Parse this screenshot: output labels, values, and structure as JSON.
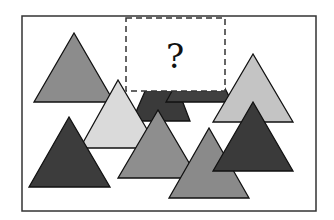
{
  "puzzle": {
    "question_mark": "?",
    "frame": {
      "x": 22,
      "y": 16,
      "width": 294,
      "height": 195,
      "stroke": "#333333"
    },
    "missing_region": {
      "x": 126,
      "y": 18,
      "width": 99,
      "height": 73,
      "fill": "#ffffff",
      "stroke": "#333333"
    },
    "colors": {
      "medium_gray": "#8c8c8c",
      "light_gray": "#d9d9d9",
      "light_gray_alt": "#c4c4c4",
      "dark_gray": "#3a3a3a",
      "outline": "#111111"
    },
    "triangles": [
      {
        "id": "hidden-dark-1",
        "shade": "dark",
        "fill": "#3a3a3a",
        "points": [
          [
            163,
            50
          ],
          [
            132,
            121
          ],
          [
            190,
            121
          ]
        ]
      },
      {
        "id": "hidden-dark-2",
        "shade": "dark",
        "fill": "#404040",
        "points": [
          [
            200,
            40
          ],
          [
            166,
            102
          ],
          [
            232,
            102
          ]
        ]
      },
      {
        "id": "top-left-medium",
        "shade": "medium",
        "fill": "#8c8c8c",
        "points": [
          [
            74,
            33
          ],
          [
            34,
            102
          ],
          [
            114,
            102
          ]
        ]
      },
      {
        "id": "right-light",
        "shade": "light",
        "fill": "#c4c4c4",
        "points": [
          [
            253,
            54
          ],
          [
            213,
            122
          ],
          [
            293,
            122
          ]
        ]
      },
      {
        "id": "center-light",
        "shade": "light",
        "fill": "#dadada",
        "points": [
          [
            118,
            80
          ],
          [
            80,
            148
          ],
          [
            158,
            148
          ]
        ]
      },
      {
        "id": "bottom-left-dark",
        "shade": "dark",
        "fill": "#3c3c3c",
        "points": [
          [
            69,
            117
          ],
          [
            29,
            187
          ],
          [
            110,
            187
          ]
        ]
      },
      {
        "id": "center-medium",
        "shade": "medium",
        "fill": "#8e8e8e",
        "points": [
          [
            158,
            110
          ],
          [
            118,
            178
          ],
          [
            198,
            178
          ]
        ]
      },
      {
        "id": "bottom-center-medium",
        "shade": "medium",
        "fill": "#8a8a8a",
        "points": [
          [
            209,
            128
          ],
          [
            169,
            198
          ],
          [
            249,
            198
          ]
        ]
      },
      {
        "id": "right-dark",
        "shade": "dark",
        "fill": "#3a3a3a",
        "points": [
          [
            253,
            102
          ],
          [
            213,
            171
          ],
          [
            293,
            171
          ]
        ]
      }
    ]
  }
}
